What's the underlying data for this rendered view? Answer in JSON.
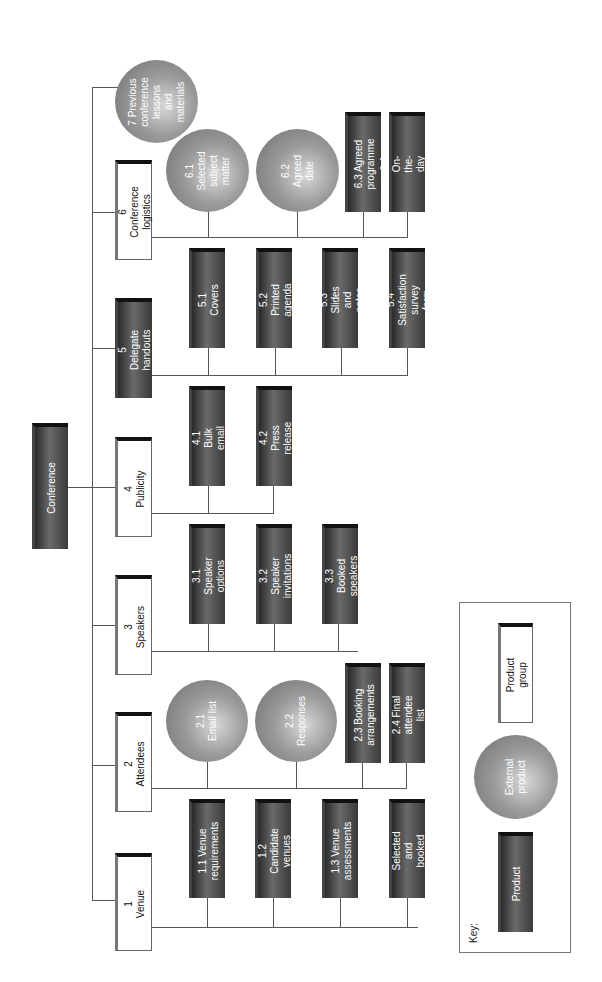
{
  "root": {
    "label": "Conference"
  },
  "groups": [
    {
      "id": "1",
      "label": "1 Venue",
      "type": "product-group",
      "children": [
        {
          "label": "1.1 Venue\nrequirements",
          "type": "product"
        },
        {
          "label": "1.2 Candidate\nvenues",
          "type": "product"
        },
        {
          "label": "1.3 Venue\nassessments",
          "type": "product"
        },
        {
          "label": "1.4 Selected and\nbooked venue",
          "type": "product"
        }
      ]
    },
    {
      "id": "2",
      "label": "2 Attendees",
      "type": "product-group",
      "children": [
        {
          "label": "2.1\nEmail list",
          "type": "external-product"
        },
        {
          "label": "2.2\nResponses",
          "type": "external-product"
        },
        {
          "label": "2.3 Booking\narrangements",
          "type": "product"
        },
        {
          "label": "2.4 Final\nattendee list",
          "type": "product"
        }
      ]
    },
    {
      "id": "3",
      "label": "3 Speakers",
      "type": "product-group",
      "children": [
        {
          "label": "3.1 Speaker\noptions",
          "type": "product"
        },
        {
          "label": "3.2 Speaker\ninvitations",
          "type": "product"
        },
        {
          "label": "3.3 Booked\nspeakers",
          "type": "product"
        }
      ]
    },
    {
      "id": "4",
      "label": "4 Publicity",
      "type": "product-group",
      "children": [
        {
          "label": "4.1 Bulk email",
          "type": "product"
        },
        {
          "label": "4.2 Press release",
          "type": "product"
        }
      ]
    },
    {
      "id": "5",
      "label": "5 Delegate\nhandouts",
      "type": "product",
      "children": [
        {
          "label": "5.1 Covers",
          "type": "product"
        },
        {
          "label": "5.2 Printed\nagenda",
          "type": "product"
        },
        {
          "label": "5.3 Slides\nand notes",
          "type": "product"
        },
        {
          "label": "5.4 Satisfaction\nsurvey form",
          "type": "product"
        }
      ]
    },
    {
      "id": "6",
      "label": "6 Conference\nlogistics",
      "type": "product-group",
      "children": [
        {
          "label": "6.1 Selected\nsubject matter",
          "type": "external-product"
        },
        {
          "label": "6.2 Agreed\ndate",
          "type": "external-product"
        },
        {
          "label": "6.3 Agreed\nprogramme",
          "type": "product"
        },
        {
          "label": "6.4 On-the-day\nstaff",
          "type": "product"
        }
      ]
    },
    {
      "id": "7",
      "label": "7 Previous\nconference\nlessons and\nmaterials",
      "type": "external-product",
      "children": []
    }
  ],
  "key": {
    "title": "Key:",
    "items": [
      {
        "label": "Product",
        "type": "product"
      },
      {
        "label": "External\nproduct",
        "type": "external-product"
      },
      {
        "label": "Product\ngroup",
        "type": "product-group"
      }
    ]
  }
}
